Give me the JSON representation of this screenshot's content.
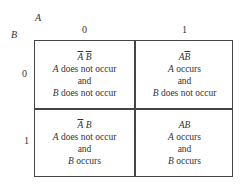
{
  "axis_labels": {
    "column_variable": "A",
    "row_variable": "B"
  },
  "column_headers": [
    "0",
    "1"
  ],
  "row_headers": [
    "0",
    "1"
  ],
  "cells": [
    {
      "row": 0,
      "col": 0,
      "symbol_a": "A",
      "symbol_a_bar": true,
      "symbol_b": "B",
      "symbol_b_bar": true,
      "line1_var": "A",
      "line1_text": " does not occur",
      "line2": "and",
      "line3_var": "B",
      "line3_text": " does not occur"
    },
    {
      "row": 0,
      "col": 1,
      "symbol_a": "A",
      "symbol_a_bar": false,
      "symbol_b": "B",
      "symbol_b_bar": true,
      "line1_var": "A",
      "line1_text": " occurs",
      "line2": "and",
      "line3_var": "B",
      "line3_text": " does not occur"
    },
    {
      "row": 1,
      "col": 0,
      "symbol_a": "A",
      "symbol_a_bar": true,
      "symbol_b": "B",
      "symbol_b_bar": false,
      "line1_var": "A",
      "line1_text": " does not occur",
      "line2": "and",
      "line3_var": "B",
      "line3_text": " occurs"
    },
    {
      "row": 1,
      "col": 1,
      "symbol_a": "A",
      "symbol_a_bar": false,
      "symbol_b": "B",
      "symbol_b_bar": false,
      "line1_var": "A",
      "line1_text": " occurs",
      "line2": "and",
      "line3_var": "B",
      "line3_text": " occurs"
    }
  ]
}
